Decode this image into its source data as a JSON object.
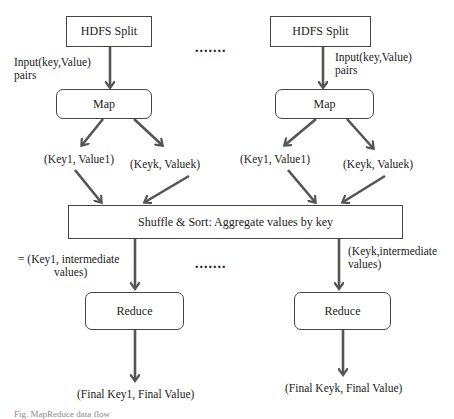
{
  "diagram": {
    "title": "MapReduce data flow",
    "left_branch": {
      "split_label": "HDFS Split",
      "input_label_line1": "Input(key,Value)",
      "input_label_line2": "pairs",
      "map_label": "Map",
      "pair1_label": "(Key1, Value1)",
      "pairk_label": "(Keyk, Valuek)",
      "intermediate_label_line1": "= (Key1, intermediate",
      "intermediate_label_line2": "values)",
      "reduce_label": "Reduce",
      "output_label": "(Final Key1, Final Value)"
    },
    "right_branch": {
      "split_label": "HDFS Split",
      "input_label_line1": "Input(key,Value)",
      "input_label_line2": "pairs",
      "map_label": "Map",
      "pair1_label": "(Key1, Value1)",
      "pairk_label": "(Keyk, Valuek)",
      "intermediate_label_line1": "(Keyk,intermediate",
      "intermediate_label_line2": "values)",
      "reduce_label": "Reduce",
      "output_label": "(Final Keyk, Final Value)"
    },
    "shuffle_label": "Shuffle & Sort: Aggregate values by key",
    "ellipsis_top": ".......",
    "ellipsis_bottom": ".......",
    "caption": "Fig. MapReduce data flow",
    "colors": {
      "arrow": "#555555",
      "border": "#444444",
      "text": "#222222"
    }
  }
}
